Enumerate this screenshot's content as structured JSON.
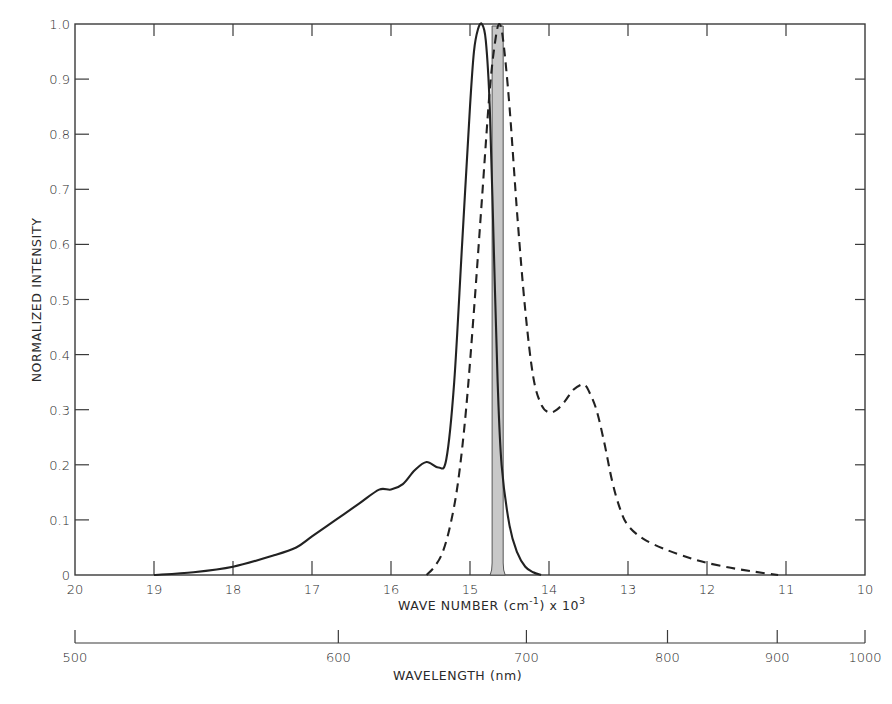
{
  "chart_data": {
    "type": "line",
    "title": "",
    "xlabel": "WAVE NUMBER (cm⁻¹) x 10³",
    "ylabel": "NORMALIZED INTENSITY",
    "secondary_xlabel": "WAVELENGTH (nm)",
    "xlim": [
      20,
      10
    ],
    "ylim": [
      0,
      1.0
    ],
    "grid": false,
    "legend": null,
    "x_ticks": [
      "20",
      "19",
      "18",
      "17",
      "16",
      "15",
      "14",
      "13",
      "12",
      "11",
      "10"
    ],
    "y_ticks": [
      "0",
      "0.1",
      "0.2",
      "0.3",
      "0.4",
      "0.5",
      "0.6",
      "0.7",
      "0.8",
      "0.9",
      "1.0"
    ],
    "secondary_x_ticks": [
      "500",
      "600",
      "700",
      "800",
      "900",
      "1000"
    ],
    "series": [
      {
        "name": "solid",
        "style": "solid",
        "x": [
          19.0,
          18.5,
          18.0,
          17.5,
          17.2,
          17.0,
          16.7,
          16.4,
          16.15,
          16.0,
          15.85,
          15.7,
          15.55,
          15.4,
          15.3,
          15.2,
          15.1,
          15.0,
          14.95,
          14.9,
          14.85,
          14.8,
          14.75,
          14.7,
          14.65,
          14.6,
          14.5,
          14.4,
          14.3,
          14.2,
          14.1
        ],
        "y": [
          0.0,
          0.005,
          0.015,
          0.035,
          0.05,
          0.07,
          0.1,
          0.13,
          0.155,
          0.155,
          0.165,
          0.19,
          0.205,
          0.195,
          0.21,
          0.35,
          0.6,
          0.85,
          0.95,
          0.99,
          1.0,
          0.97,
          0.85,
          0.6,
          0.35,
          0.2,
          0.09,
          0.04,
          0.015,
          0.005,
          0.0
        ]
      },
      {
        "name": "dashed",
        "style": "dashed",
        "x": [
          15.55,
          15.45,
          15.35,
          15.25,
          15.15,
          15.05,
          14.95,
          14.85,
          14.75,
          14.68,
          14.63,
          14.58,
          14.5,
          14.4,
          14.3,
          14.2,
          14.1,
          14.0,
          13.9,
          13.8,
          13.7,
          13.6,
          13.55,
          13.5,
          13.4,
          13.3,
          13.2,
          13.1,
          13.0,
          12.8,
          12.5,
          12.2,
          12.0,
          11.7,
          11.4,
          11.1
        ],
        "y": [
          0.0,
          0.015,
          0.04,
          0.09,
          0.17,
          0.3,
          0.48,
          0.68,
          0.88,
          0.97,
          1.0,
          0.97,
          0.85,
          0.65,
          0.48,
          0.36,
          0.31,
          0.295,
          0.3,
          0.315,
          0.335,
          0.345,
          0.345,
          0.335,
          0.3,
          0.24,
          0.17,
          0.12,
          0.09,
          0.065,
          0.045,
          0.03,
          0.022,
          0.013,
          0.006,
          0.0
        ]
      },
      {
        "name": "shaded-band",
        "style": "filled",
        "x": [
          14.72,
          14.58
        ],
        "y": [
          1.0,
          1.0
        ]
      }
    ]
  },
  "labels": {
    "ylabel": "NORMALIZED INTENSITY",
    "xlabel_main": "WAVE NUMBER (cm",
    "xlabel_sup1": "-1",
    "xlabel_mid": ") x 10",
    "xlabel_sup2": "3",
    "wavelength_label": "WAVELENGTH (nm)"
  },
  "colors": {
    "ink": "#222222",
    "axis": "#3a3a3a",
    "band_fill": "#c8c8c8"
  }
}
